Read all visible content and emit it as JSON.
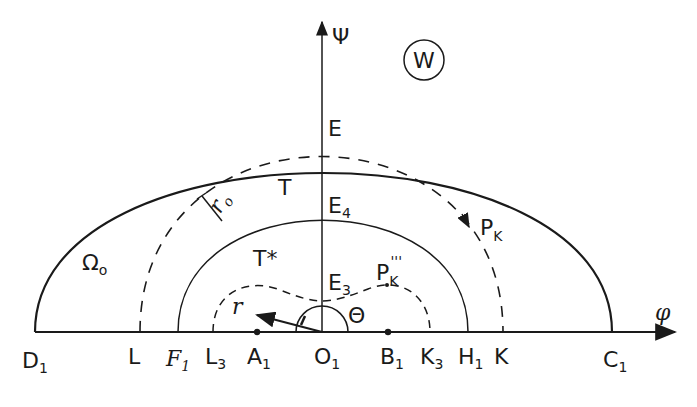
{
  "diagram": {
    "plane_label": "W",
    "axes": {
      "vertical": {
        "label": "Ψ"
      },
      "horizontal": {
        "label": "φ"
      }
    },
    "regions": {
      "outer": {
        "label": "Ω",
        "sub": "o"
      },
      "T": {
        "label": "T"
      },
      "T_star": {
        "label": "T*"
      }
    },
    "points_axis": [
      {
        "id": "D1",
        "label": "D",
        "sub": "1"
      },
      {
        "id": "L",
        "label": "L",
        "sub": ""
      },
      {
        "id": "F1",
        "label": "F",
        "sub": "1"
      },
      {
        "id": "L3",
        "label": "L",
        "sub": "3"
      },
      {
        "id": "A1",
        "label": "A",
        "sub": "1"
      },
      {
        "id": "O1",
        "label": "O",
        "sub": "1"
      },
      {
        "id": "B1",
        "label": "B",
        "sub": "1"
      },
      {
        "id": "K3",
        "label": "K",
        "sub": "3"
      },
      {
        "id": "H1",
        "label": "H",
        "sub": "1"
      },
      {
        "id": "K",
        "label": "K",
        "sub": ""
      },
      {
        "id": "C1",
        "label": "C",
        "sub": "1"
      }
    ],
    "points_vertical": [
      {
        "id": "E",
        "label": "E",
        "sub": ""
      },
      {
        "id": "E4",
        "label": "E",
        "sub": "4"
      },
      {
        "id": "E3",
        "label": "E",
        "sub": "3"
      }
    ],
    "curves": {
      "P_K": {
        "label": "P",
        "sub": "K"
      },
      "P_K3": {
        "label": "P",
        "sub": "K",
        "sup": "'''"
      }
    },
    "annotations": {
      "r0": {
        "label": "r",
        "sub": "o"
      },
      "r": {
        "label": "r"
      },
      "theta": {
        "label": "Θ"
      }
    }
  }
}
